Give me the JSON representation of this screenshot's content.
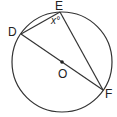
{
  "diagram": {
    "type": "circle-geometry",
    "center": {
      "label": "O"
    },
    "points": [
      {
        "label": "D"
      },
      {
        "label": "E"
      },
      {
        "label": "F"
      }
    ],
    "angle": {
      "vertex": "E",
      "label": "x°"
    },
    "segments": [
      "DE",
      "EF",
      "DF"
    ]
  }
}
